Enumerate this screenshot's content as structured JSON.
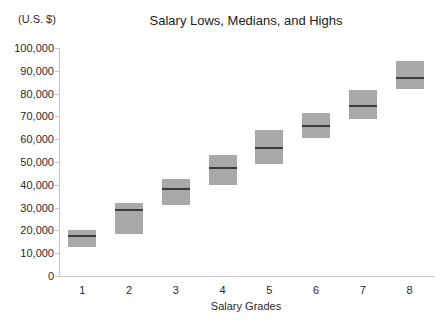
{
  "title": "Salary Lows, Medians, and Highs",
  "y_axis_unit": "(U.S. $)",
  "chart_data": {
    "type": "bar",
    "variant": "floating-range-boxes-with-median-line",
    "title": "Salary Lows, Medians, and Highs",
    "xlabel": "Salary Grades",
    "ylabel": "(U.S. $)",
    "categories": [
      "1",
      "2",
      "3",
      "4",
      "5",
      "6",
      "7",
      "8"
    ],
    "series": [
      {
        "name": "Low",
        "values": [
          12500,
          18500,
          31000,
          40000,
          49000,
          60500,
          69000,
          82000
        ]
      },
      {
        "name": "Median",
        "values": [
          17500,
          29000,
          38000,
          47500,
          56000,
          66000,
          74500,
          87000
        ]
      },
      {
        "name": "High",
        "values": [
          20000,
          32000,
          42500,
          53000,
          64000,
          71500,
          81500,
          94500
        ]
      }
    ],
    "ylim": [
      0,
      100000
    ],
    "y_tick_step": 10000,
    "y_tick_values": [
      0,
      10000,
      20000,
      30000,
      40000,
      50000,
      60000,
      70000,
      80000,
      90000,
      100000
    ],
    "y_tick_labels": [
      "0",
      "10,000",
      "20,000",
      "30,000",
      "40,000",
      "50,000",
      "60,000",
      "70,000",
      "80,000",
      "90,000",
      "100,000"
    ],
    "grid": false,
    "legend": false
  },
  "colors": {
    "background": "#ffffff",
    "box_fill": "#a8a8a8",
    "median_line": "#3a3a3a",
    "axis_line": "#c6c6c6",
    "text": "#2a2a2a"
  }
}
